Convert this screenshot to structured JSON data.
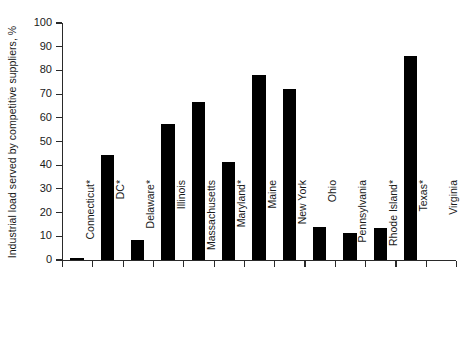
{
  "chart_data": {
    "type": "bar",
    "title": "",
    "subtitle": "",
    "xlabel": "",
    "ylabel": "Industrial load served by competitive suppliers, %",
    "ylim": [
      0,
      100
    ],
    "yticks": [
      0,
      10,
      20,
      30,
      40,
      50,
      60,
      70,
      80,
      90,
      100
    ],
    "grid": false,
    "legend": null,
    "bar_color": "#000000",
    "axis_color": "#2a2a2a",
    "categories": [
      "Connecticut*",
      "DC*",
      "Delaware*",
      "Illinois",
      "Massachusetts",
      "Maryland*",
      "Maine",
      "New York",
      "Ohio",
      "Pennsylvania",
      "Rhode Island*",
      "Texas*",
      "Virginia"
    ],
    "values": [
      0.5,
      44.5,
      8.5,
      57.5,
      66.5,
      41.5,
      78,
      72,
      14,
      11.5,
      13.5,
      86,
      0
    ]
  }
}
